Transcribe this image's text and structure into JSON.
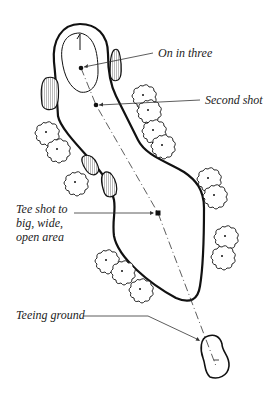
{
  "diagram": {
    "type": "golf-hole-layout",
    "labels": {
      "on_in_three": "On in three",
      "second_shot": "Second shot",
      "tee_shot_line1": "Tee shot to",
      "tee_shot_line2": "big, wide,",
      "tee_shot_line3": "open area",
      "teeing_ground": "Teeing ground"
    },
    "elements": [
      "fairway",
      "green",
      "flag",
      "bunkers",
      "trees",
      "tee-box",
      "shot-line"
    ],
    "shots": [
      {
        "name": "tee-shot",
        "label": "Tee shot to big, wide, open area"
      },
      {
        "name": "second-shot",
        "label": "Second shot"
      },
      {
        "name": "approach",
        "label": "On in three"
      }
    ],
    "colors": {
      "ink": "#111111",
      "background": "#ffffff"
    }
  }
}
